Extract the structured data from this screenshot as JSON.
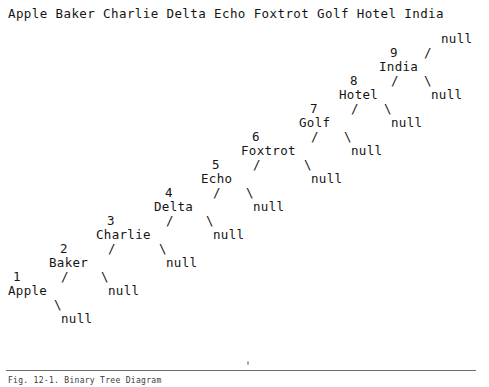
{
  "header": {
    "names": [
      "Apple",
      "Baker",
      "Charlie",
      "Delta",
      "Echo",
      "Foxtrot",
      "Golf",
      "Hotel",
      "India"
    ],
    "text": "Apple Baker Charlie Delta Echo Foxtrot Golf Hotel India"
  },
  "footer": {
    "caption": "Fig. 12-1.  Binary Tree Diagram",
    "rule": true
  },
  "tree": {
    "null_label": "null",
    "left_branch_glyph": "/",
    "right_branch_glyph": "\\",
    "root_index": 9,
    "description": "Right-leaning degenerate binary tree; node N has left child N-1 and right child null",
    "nodes": [
      {
        "index": "9",
        "label": "India",
        "x_index": 390,
        "y_index": 46,
        "x_label": 379,
        "y_label": 60,
        "left_branch_x": 391,
        "left_branch_y": 74,
        "right_branch_x": 424,
        "right_branch_y": 74,
        "right_null_x": 431,
        "right_null_y": 88,
        "top_null_x": 441,
        "top_null_y": 32,
        "top_branch_x": 424,
        "top_branch_y": 46
      },
      {
        "index": "8",
        "label": "Hotel",
        "x_index": 350,
        "y_index": 74,
        "x_label": 339,
        "y_label": 88,
        "left_branch_x": 351,
        "left_branch_y": 102,
        "right_branch_x": 384,
        "right_branch_y": 102,
        "right_null_x": 391,
        "right_null_y": 116
      },
      {
        "index": "7",
        "label": "Golf",
        "x_index": 310,
        "y_index": 102,
        "x_label": 299,
        "y_label": 116,
        "left_branch_x": 311,
        "left_branch_y": 130,
        "right_branch_x": 344,
        "right_branch_y": 130,
        "right_null_x": 351,
        "right_null_y": 144
      },
      {
        "index": "6",
        "label": "Foxtrot",
        "x_index": 252,
        "y_index": 130,
        "x_label": 241,
        "y_label": 144,
        "left_branch_x": 253,
        "left_branch_y": 158,
        "right_branch_x": 304,
        "right_branch_y": 158,
        "right_null_x": 311,
        "right_null_y": 172
      },
      {
        "index": "5",
        "label": "Echo",
        "x_index": 212,
        "y_index": 158,
        "x_label": 201,
        "y_label": 172,
        "left_branch_x": 213,
        "left_branch_y": 186,
        "right_branch_x": 246,
        "right_branch_y": 186,
        "right_null_x": 253,
        "right_null_y": 200
      },
      {
        "index": "4",
        "label": "Delta",
        "x_index": 165,
        "y_index": 186,
        "x_label": 154,
        "y_label": 200,
        "left_branch_x": 166,
        "left_branch_y": 214,
        "right_branch_x": 206,
        "right_branch_y": 214,
        "right_null_x": 213,
        "right_null_y": 228
      },
      {
        "index": "3",
        "label": "Charlie",
        "x_index": 107,
        "y_index": 214,
        "x_label": 96,
        "y_label": 228,
        "left_branch_x": 108,
        "left_branch_y": 242,
        "right_branch_x": 159,
        "right_branch_y": 242,
        "right_null_x": 166,
        "right_null_y": 256
      },
      {
        "index": "2",
        "label": "Baker",
        "x_index": 60,
        "y_index": 242,
        "x_label": 49,
        "y_label": 256,
        "left_branch_x": 61,
        "left_branch_y": 270,
        "right_branch_x": 101,
        "right_branch_y": 270,
        "right_null_x": 108,
        "right_null_y": 284
      },
      {
        "index": "1",
        "label": "Apple",
        "x_index": 13,
        "y_index": 270,
        "x_label": 8,
        "y_label": 284,
        "left_branch_x": 0,
        "left_branch_y": 0,
        "right_branch_x": 54,
        "right_branch_y": 298,
        "right_null_x": 61,
        "right_null_y": 312
      }
    ]
  }
}
